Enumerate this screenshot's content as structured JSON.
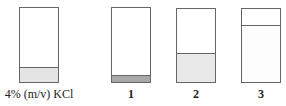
{
  "diagram": {
    "beakers": [
      {
        "id": "reference",
        "label": "4% (m/v) KCl",
        "fill_height_px": 14,
        "fill_color": "#e4e4e4",
        "left": 19,
        "width": 40
      },
      {
        "id": "1",
        "label": "1",
        "fill_height_px": 6,
        "fill_color": "#a9a9a9",
        "left": 111,
        "width": 40
      },
      {
        "id": "2",
        "label": "2",
        "fill_height_px": 28,
        "fill_color": "#e8e8e8",
        "left": 176,
        "width": 40
      },
      {
        "id": "3",
        "label": "3",
        "fill_height_px": 56,
        "fill_color": "#ffffff",
        "left": 241,
        "width": 40
      }
    ]
  }
}
